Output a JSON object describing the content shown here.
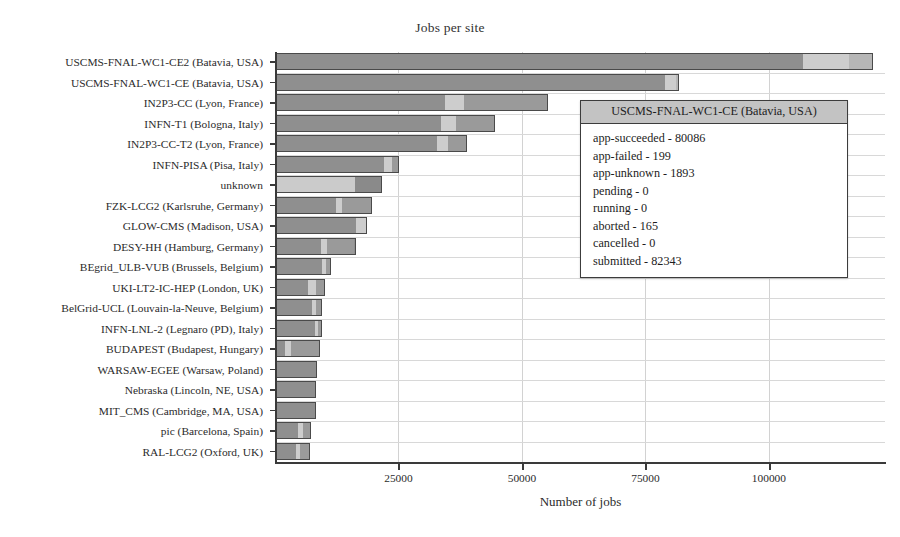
{
  "chart_data": {
    "type": "bar",
    "orientation": "horizontal",
    "stacked": true,
    "title": "Jobs per site",
    "xlabel": "Number of jobs",
    "ylabel": "",
    "xlim": [
      0,
      123500
    ],
    "xticks": [
      25000,
      50000,
      75000,
      100000
    ],
    "xtick_labels": [
      "25000",
      "50000",
      "75000",
      "100000"
    ],
    "grid": true,
    "legend": "none",
    "series": [
      {
        "name": "app-succeeded",
        "color": "#8f8f8f"
      },
      {
        "name": "app-unknown",
        "color": "#cbcbcb"
      },
      {
        "name": "aborted",
        "color": "#a8a8a8"
      }
    ],
    "categories": [
      "USCMS-FNAL-WC1-CE2 (Batavia, USA)",
      "USCMS-FNAL-WC1-CE (Batavia, USA)",
      "IN2P3-CC (Lyon, France)",
      "INFN-T1 (Bologna, Italy)",
      "IN2P3-CC-T2 (Lyon, France)",
      "INFN-PISA (Pisa, Italy)",
      "unknown",
      "FZK-LCG2 (Karlsruhe, Germany)",
      "GLOW-CMS (Madison, USA)",
      "DESY-HH (Hamburg, Germany)",
      "BEgrid_ULB-VUB (Brussels, Belgium)",
      "UKI-LT2-IC-HEP (London, UK)",
      "BelGrid-UCL (Louvain-la-Neuve, Belgium)",
      "INFN-LNL-2 (Legnaro (PD), Italy)",
      "BUDAPEST (Budapest, Hungary)",
      "WARSAW-EGEE (Warsaw, Poland)",
      "Nebraska (Lincoln, NE, USA)",
      "MIT_CMS (Cambridge, MA, USA)",
      "pic (Barcelona, Spain)",
      "RAL-LCG2 (Oxford, UK)"
    ],
    "values": [
      121000,
      81700,
      55300,
      44600,
      38900,
      25100,
      21600,
      19700,
      18700,
      16300,
      11400,
      10100,
      9600,
      9500,
      9200,
      8600,
      8400,
      8300,
      7200,
      7100
    ],
    "bars": [
      {
        "total": 121000,
        "segments": [
          {
            "value": 107000,
            "color": "#8f8f8f"
          },
          {
            "value": 9500,
            "color": "#cdcdcd"
          },
          {
            "value": 4500,
            "color": "#b6b6b6"
          }
        ]
      },
      {
        "total": 81700,
        "segments": [
          {
            "value": 79200,
            "color": "#8f8f8f"
          },
          {
            "value": 2100,
            "color": "#cdcdcd"
          },
          {
            "value": 400,
            "color": "#b6b6b6"
          }
        ]
      },
      {
        "total": 55300,
        "segments": [
          {
            "value": 34500,
            "color": "#8f8f8f"
          },
          {
            "value": 3800,
            "color": "#cdcdcd"
          },
          {
            "value": 17000,
            "color": "#9a9a9a"
          }
        ]
      },
      {
        "total": 44600,
        "segments": [
          {
            "value": 33800,
            "color": "#8f8f8f"
          },
          {
            "value": 3000,
            "color": "#cdcdcd"
          },
          {
            "value": 7800,
            "color": "#9a9a9a"
          }
        ]
      },
      {
        "total": 38900,
        "segments": [
          {
            "value": 33000,
            "color": "#8f8f8f"
          },
          {
            "value": 2200,
            "color": "#cdcdcd"
          },
          {
            "value": 3700,
            "color": "#9a9a9a"
          }
        ]
      },
      {
        "total": 25100,
        "segments": [
          {
            "value": 22300,
            "color": "#8f8f8f"
          },
          {
            "value": 1500,
            "color": "#cdcdcd"
          },
          {
            "value": 1300,
            "color": "#9a9a9a"
          }
        ]
      },
      {
        "total": 21600,
        "segments": [
          {
            "value": 16200,
            "color": "#cbcbcb"
          },
          {
            "value": 5400,
            "color": "#8a8a8a"
          }
        ]
      },
      {
        "total": 19700,
        "segments": [
          {
            "value": 12300,
            "color": "#8f8f8f"
          },
          {
            "value": 1300,
            "color": "#cdcdcd"
          },
          {
            "value": 6100,
            "color": "#9a9a9a"
          }
        ]
      },
      {
        "total": 18700,
        "segments": [
          {
            "value": 16600,
            "color": "#8f8f8f"
          },
          {
            "value": 2100,
            "color": "#cdcdcd"
          }
        ]
      },
      {
        "total": 16300,
        "segments": [
          {
            "value": 9400,
            "color": "#8f8f8f"
          },
          {
            "value": 1200,
            "color": "#cdcdcd"
          },
          {
            "value": 5700,
            "color": "#9a9a9a"
          }
        ]
      },
      {
        "total": 11400,
        "segments": [
          {
            "value": 9600,
            "color": "#8f8f8f"
          },
          {
            "value": 800,
            "color": "#cdcdcd"
          },
          {
            "value": 1000,
            "color": "#9a9a9a"
          }
        ]
      },
      {
        "total": 10100,
        "segments": [
          {
            "value": 6700,
            "color": "#8f8f8f"
          },
          {
            "value": 1700,
            "color": "#cdcdcd"
          },
          {
            "value": 1700,
            "color": "#9a9a9a"
          }
        ]
      },
      {
        "total": 9600,
        "segments": [
          {
            "value": 7700,
            "color": "#8f8f8f"
          },
          {
            "value": 700,
            "color": "#cdcdcd"
          },
          {
            "value": 1200,
            "color": "#9a9a9a"
          }
        ]
      },
      {
        "total": 9500,
        "segments": [
          {
            "value": 8200,
            "color": "#8f8f8f"
          },
          {
            "value": 600,
            "color": "#cdcdcd"
          },
          {
            "value": 700,
            "color": "#9a9a9a"
          }
        ]
      },
      {
        "total": 9200,
        "segments": [
          {
            "value": 2000,
            "color": "#8f8f8f"
          },
          {
            "value": 1100,
            "color": "#cdcdcd"
          },
          {
            "value": 6100,
            "color": "#9a9a9a"
          }
        ]
      },
      {
        "total": 8600,
        "segments": [
          {
            "value": 8600,
            "color": "#8f8f8f"
          }
        ]
      },
      {
        "total": 8400,
        "segments": [
          {
            "value": 8400,
            "color": "#8f8f8f"
          }
        ]
      },
      {
        "total": 8300,
        "segments": [
          {
            "value": 8300,
            "color": "#8f8f8f"
          }
        ]
      },
      {
        "total": 7200,
        "segments": [
          {
            "value": 4800,
            "color": "#8f8f8f"
          },
          {
            "value": 900,
            "color": "#cdcdcd"
          },
          {
            "value": 1500,
            "color": "#9a9a9a"
          }
        ]
      },
      {
        "total": 7100,
        "segments": [
          {
            "value": 4300,
            "color": "#8f8f8f"
          },
          {
            "value": 800,
            "color": "#cdcdcd"
          },
          {
            "value": 2000,
            "color": "#9a9a9a"
          }
        ]
      }
    ]
  },
  "tooltip": {
    "title": "USCMS-FNAL-WC1-CE (Batavia, USA)",
    "rows": [
      "app-succeeded - 80086",
      "app-failed - 199",
      "app-unknown - 1893",
      "pending - 0",
      "running - 0",
      "aborted - 165",
      "cancelled - 0",
      "submitted - 82343"
    ]
  },
  "colors": {
    "axis": "#3a3a3a",
    "grid": "#d8d8d8",
    "bar_border": "#4a4a4a",
    "tooltip_header_bg": "#c3c3c3",
    "tooltip_border": "#3c3c3c",
    "background": "#ffffff"
  }
}
